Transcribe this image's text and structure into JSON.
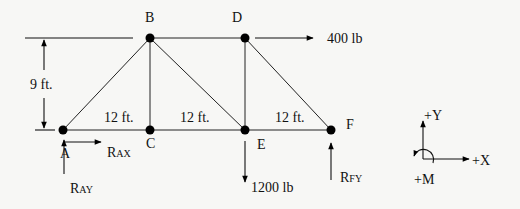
{
  "diagram": {
    "type": "truss-free-body-diagram",
    "joints": [
      {
        "id": "A",
        "label": "A",
        "x": 63,
        "y": 130
      },
      {
        "id": "B",
        "label": "B",
        "x": 150,
        "y": 38
      },
      {
        "id": "C",
        "label": "C",
        "x": 150,
        "y": 130
      },
      {
        "id": "D",
        "label": "D",
        "x": 245,
        "y": 38
      },
      {
        "id": "E",
        "label": "E",
        "x": 245,
        "y": 130
      },
      {
        "id": "F",
        "label": "F",
        "x": 331,
        "y": 130
      }
    ],
    "members": [
      "A-B",
      "A-C",
      "C-E",
      "E-F",
      "B-D",
      "B-C",
      "B-E",
      "D-E",
      "D-F"
    ],
    "dimensions": {
      "height": "9 ft.",
      "spans": [
        "12 ft.",
        "12 ft.",
        "12 ft."
      ]
    },
    "loads": [
      {
        "joint": "D",
        "label": "400 lb",
        "direction": "right"
      },
      {
        "joint": "E",
        "label": "1200 lb",
        "direction": "down"
      }
    ],
    "reactions": [
      {
        "joint": "A",
        "label_main": "R",
        "label_sub": "AX",
        "direction": "right"
      },
      {
        "joint": "A",
        "label_main": "R",
        "label_sub": "AY",
        "direction": "up"
      },
      {
        "joint": "F",
        "label_main": "R",
        "label_sub": "FY",
        "direction": "up"
      }
    ],
    "sign_convention": {
      "y_label": "+Y",
      "x_label": "+X",
      "m_label": "+M"
    }
  }
}
